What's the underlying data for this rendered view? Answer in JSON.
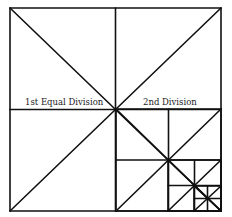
{
  "diagram": {
    "type": "recursive-square-subdivision",
    "stroke_color": "#111111",
    "background": "#ffffff",
    "labels": {
      "first": "1st Equal Division",
      "second": "2nd Division"
    },
    "outer_square": {
      "x1": 10,
      "y1": 8,
      "x2": 221,
      "y2": 211
    },
    "levels": [
      {
        "level": 1,
        "x1": 10,
        "y1": 8,
        "x2": 221,
        "y2": 211,
        "center": [
          116,
          109
        ]
      },
      {
        "level": 2,
        "x1": 116,
        "y1": 109,
        "x2": 221,
        "y2": 211,
        "center": [
          168,
          160
        ]
      },
      {
        "level": 3,
        "x1": 168,
        "y1": 160,
        "x2": 221,
        "y2": 211,
        "center": [
          194,
          186
        ]
      },
      {
        "level": 4,
        "x1": 194,
        "y1": 186,
        "x2": 221,
        "y2": 211,
        "center": [
          207,
          199
        ]
      }
    ]
  }
}
